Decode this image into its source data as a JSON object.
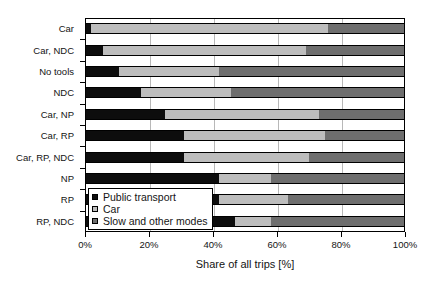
{
  "chart_data": {
    "type": "bar",
    "orientation": "horizontal",
    "stacked": true,
    "normalized_percent": true,
    "title": "",
    "xlabel": "Share of all trips [%]",
    "ylabel": "",
    "xlim": [
      0,
      100
    ],
    "xticks": [
      0,
      20,
      40,
      60,
      80,
      100
    ],
    "xticklabels": [
      "0%",
      "20%",
      "40%",
      "60%",
      "80%",
      "100%"
    ],
    "grid": "vertical",
    "legend_position": "inner-lower-left",
    "categories": [
      "Car",
      "Car, NDC",
      "No tools",
      "NDC",
      "Car, NP",
      "Car, RP",
      "Car, RP, NDC",
      "NP",
      "RP",
      "RP, NDC"
    ],
    "series": [
      {
        "name": "Public transport",
        "color": "#0d0d0d",
        "values": [
          2,
          5.5,
          10.5,
          17.5,
          25,
          31,
          31,
          42,
          42,
          47
        ]
      },
      {
        "name": "Car",
        "color": "#bdbdbd",
        "values": [
          74,
          63.5,
          31.5,
          28,
          48,
          44,
          39,
          16,
          21.5,
          11
        ]
      },
      {
        "name": "Slow and other modes",
        "color": "#6e6e6e",
        "values": [
          24,
          31,
          58,
          54.5,
          27,
          25,
          30,
          42,
          36.5,
          42
        ]
      }
    ]
  },
  "legend": {
    "items": [
      {
        "label": "Public transport",
        "color": "#0d0d0d"
      },
      {
        "label": "Car",
        "color": "#bdbdbd"
      },
      {
        "label": "Slow and other modes",
        "color": "#6e6e6e"
      }
    ]
  }
}
